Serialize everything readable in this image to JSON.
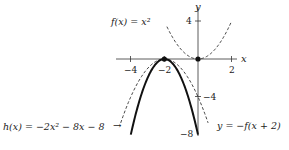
{
  "diagram": {
    "type": "function-graph",
    "axes": {
      "x_label": "x",
      "y_label": "y",
      "x_ticks": [
        {
          "value": -4,
          "label": "−4"
        },
        {
          "value": -2,
          "label": "−2"
        },
        {
          "value": 2,
          "label": "2"
        }
      ],
      "y_ticks": [
        {
          "value": 4,
          "label": "4"
        },
        {
          "value": -4,
          "label": "−4"
        },
        {
          "value": -8,
          "label": "−8"
        }
      ]
    },
    "curves": [
      {
        "id": "f",
        "label": "f(x) = x²",
        "equation": "y = x^2",
        "style": "dashed",
        "x_range": [
          -1.85,
          2.0
        ]
      },
      {
        "id": "shifted",
        "label": "y = −f(x + 2)",
        "equation": "y = -(x+2)^2",
        "style": "dashed",
        "x_range": [
          -4.6,
          0.6
        ]
      },
      {
        "id": "h",
        "label": "h(x) = −2x² − 8x − 8",
        "equation": "y = -2(x+2)^2",
        "style": "solid-bold",
        "x_range": [
          -4.0,
          0.0
        ]
      }
    ],
    "points": [
      {
        "x": -2,
        "y": 0,
        "label": "vertex (−2, 0)"
      },
      {
        "x": 0,
        "y": 0,
        "label": "vertex (0, 0)"
      }
    ],
    "labels": {
      "f_label": "f(x) = x²",
      "shifted_label": "y = −f(x + 2)",
      "h_label": "h(x) = −2x² − 8x − 8",
      "arrow": "→"
    },
    "colors": {
      "ink": "#1a1a1a",
      "background": "#ffffff"
    }
  }
}
